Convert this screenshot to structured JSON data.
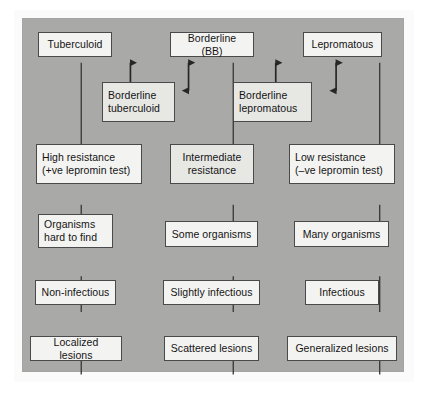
{
  "figure": {
    "panel_color": "#a9a9a7",
    "box_fill": "#f3f3f1",
    "box_border": "#4a4a4a",
    "line_color": "#3a3a3a"
  },
  "columns": [
    {
      "id": "tuberculoid",
      "label": "Tuberculoid pole"
    },
    {
      "id": "borderline-bb",
      "label": "Borderline (BB) pole"
    },
    {
      "id": "lepromatous",
      "label": "Lepromatous pole"
    }
  ],
  "nodes": {
    "classification": [
      {
        "id": "tuberculoid",
        "text": "Tuberculoid"
      },
      {
        "id": "borderline-bb",
        "text": "Borderline (BB)"
      },
      {
        "id": "lepromatous",
        "text": "Lepromatous"
      }
    ],
    "borderline": [
      {
        "id": "borderline-tuberculoid",
        "text": "Borderline\ntuberculoid"
      },
      {
        "id": "borderline-lepromatous",
        "text": "Borderline\nlepromatous"
      }
    ],
    "resistance": [
      {
        "id": "high-resistance",
        "text": "High resistance\n(+ve lepromin test)"
      },
      {
        "id": "intermediate-resistance",
        "text": "Intermediate\nresistance"
      },
      {
        "id": "low-resistance",
        "text": "Low resistance\n(–ve lepromin test)"
      }
    ],
    "organisms": [
      {
        "id": "organisms-hard-to-find",
        "text": "Organisms\nhard to find"
      },
      {
        "id": "some-organisms",
        "text": "Some organisms"
      },
      {
        "id": "many-organisms",
        "text": "Many organisms"
      }
    ],
    "infectivity": [
      {
        "id": "non-infectious",
        "text": "Non-infectious"
      },
      {
        "id": "slightly-infectious",
        "text": "Slightly infectious"
      },
      {
        "id": "infectious",
        "text": "Infectious"
      }
    ],
    "lesions": [
      {
        "id": "localized-lesions",
        "text": "Localized lesions"
      },
      {
        "id": "scattered-lesions",
        "text": "Scattered lesions"
      },
      {
        "id": "generalized-lesions",
        "text": "Generalized lesions"
      }
    ]
  },
  "connectors": {
    "bidirectional_arrow_count": 4,
    "description": "Double-headed vertical arrows link the classification row to the borderline boxes; plain vertical lines link each column downward."
  }
}
